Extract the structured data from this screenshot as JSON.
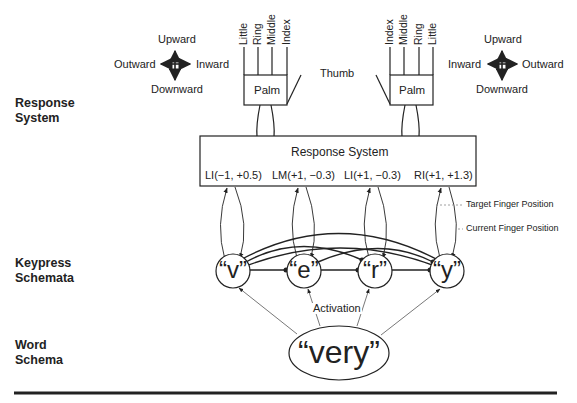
{
  "row_labels": {
    "response_system": [
      "Response",
      "System"
    ],
    "keypress_schemata": [
      "Keypress",
      "Schemata"
    ],
    "word_schema": [
      "Word",
      "Schema"
    ]
  },
  "left_hand": {
    "direction_labels": {
      "up": "Upward",
      "down": "Downward",
      "left": "Outward",
      "right": "Inward"
    },
    "fingers": [
      "Little",
      "Ring",
      "Middle",
      "Index"
    ],
    "palm": "Palm"
  },
  "right_hand": {
    "direction_labels": {
      "up": "Upward",
      "down": "Downward",
      "left": "Inward",
      "right": "Outward"
    },
    "fingers": [
      "Index",
      "Middle",
      "Ring",
      "Little"
    ],
    "palm": "Palm"
  },
  "thumb_label": "Thumb",
  "response_box": {
    "title": "Response System",
    "targets": [
      "LI(−1, +0.5)",
      "LM(+1, −0.3)",
      "LI(+1, −0.3)",
      "RI(+1, +1.3)"
    ]
  },
  "annotations": {
    "target": "Target Finger Position",
    "current": "Current Finger Position",
    "activation": "Activation"
  },
  "keypress_nodes": [
    "“v”",
    "“e”",
    "“r”",
    "“y”"
  ],
  "word_node": "“very”"
}
